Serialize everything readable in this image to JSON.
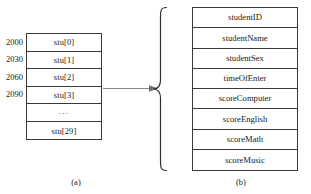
{
  "figure": {
    "type": "struct-array-diagram",
    "colors": {
      "stroke": "#3a3a3a",
      "arrow": "#8a8a8a",
      "background": "#ffffff",
      "text": "#1a1a1a"
    }
  },
  "panel_a": {
    "caption": "(a)",
    "addresses": [
      "2000",
      "2030",
      "2060",
      "2090"
    ],
    "cells": [
      "stu[0]",
      "stu[1]",
      "stu[2]",
      "stu[3]",
      "...",
      "stu[29]"
    ]
  },
  "connector": {
    "arrow_icon": "right-arrow-icon",
    "brace_icon": "left-curly-brace-icon"
  },
  "panel_b": {
    "caption": "(b)",
    "fields": [
      "studentID",
      "studentName",
      "studentSex",
      "timeOfEnter",
      "scoreComputer",
      "scoreEnglish",
      "scoreMath",
      "scoreMusic"
    ]
  }
}
